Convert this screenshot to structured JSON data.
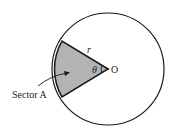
{
  "diagram": {
    "type": "circle-sector",
    "colors": {
      "stroke": "#1a1a1a",
      "sector_fill": "#b3b3b3",
      "background": "#ffffff"
    },
    "circle": {
      "cx": 108,
      "cy": 69,
      "r": 56
    },
    "center_label": "O",
    "radius_label": "r",
    "angle_label": "θ",
    "sector_label": "Sector A"
  }
}
